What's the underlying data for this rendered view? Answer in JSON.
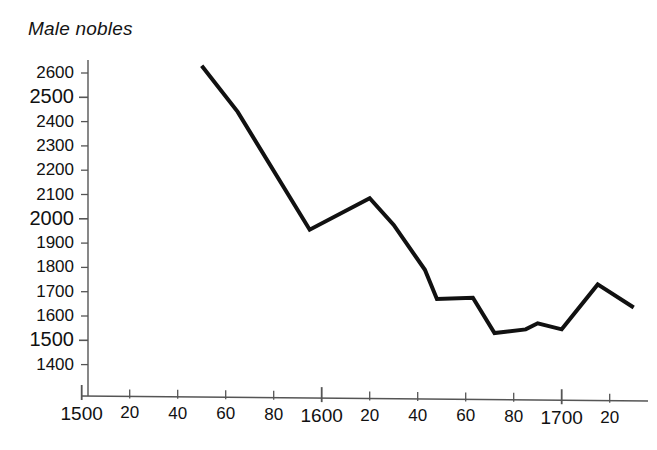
{
  "chart": {
    "title": "Male nobles",
    "title_style": "italic"
  },
  "chart_data": {
    "type": "line",
    "title": "Male nobles",
    "xlabel": "",
    "ylabel": "",
    "series": [
      {
        "name": "Male nobles",
        "x": [
          1550,
          1565,
          1595,
          1620,
          1630,
          1643,
          1648,
          1663,
          1672,
          1685,
          1690,
          1700,
          1715,
          1730
        ],
        "values": [
          2630,
          2440,
          1955,
          2085,
          1975,
          1790,
          1670,
          1675,
          1530,
          1545,
          1570,
          1545,
          1730,
          1635
        ]
      }
    ],
    "xlim": [
      1500,
      1733
    ],
    "ylim": [
      1370,
      2650
    ],
    "xticks": [
      1500,
      1520,
      1540,
      1560,
      1580,
      1600,
      1620,
      1640,
      1660,
      1680,
      1700,
      1720
    ],
    "xtick_labels": [
      "1500",
      "20",
      "40",
      "60",
      "80",
      "1600",
      "20",
      "40",
      "60",
      "80",
      "1700",
      "20"
    ],
    "xtick_major": [
      true,
      false,
      false,
      false,
      false,
      true,
      false,
      false,
      false,
      false,
      true,
      false
    ],
    "yticks": [
      1400,
      1500,
      1600,
      1700,
      1800,
      1900,
      2000,
      2100,
      2200,
      2300,
      2400,
      2500,
      2600
    ],
    "ytick_labels": [
      "1400",
      "1500",
      "1600",
      "1700",
      "1800",
      "1900",
      "2000",
      "2100",
      "2200",
      "2300",
      "2400",
      "2500",
      "2600"
    ],
    "ytick_major": [
      false,
      true,
      false,
      false,
      false,
      false,
      true,
      false,
      false,
      false,
      false,
      true,
      false
    ],
    "grid": false,
    "legend": "none",
    "line_color": "#111111",
    "line_width": 4,
    "axis_color": "#555555"
  }
}
